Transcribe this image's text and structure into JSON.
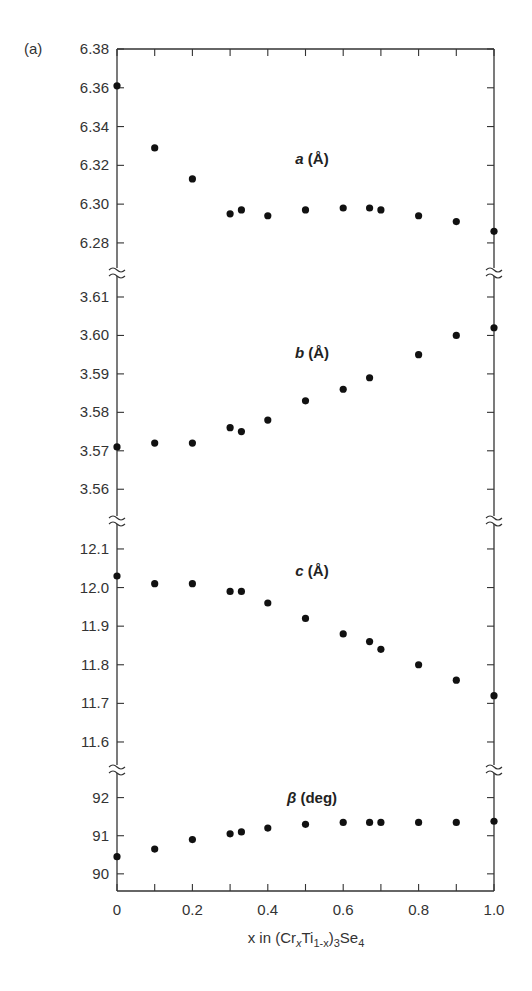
{
  "figure_label": "(a)",
  "chart_data": {
    "type": "scatter",
    "layout": "stacked-panels-shared-x-with-axis-breaks",
    "xlabel": "x in (CrxTi1-x)3Se4",
    "xlabel_parts": {
      "pre": "x in (Cr",
      "sub1": "x",
      "mid": "Ti",
      "sub2": "1-x",
      "post1": ")",
      "sub3": "3",
      "post2": "Se",
      "sub4": "4"
    },
    "xlim": [
      0,
      1.0
    ],
    "x_ticks": [
      0,
      0.1,
      0.2,
      0.3,
      0.4,
      0.5,
      0.6,
      0.7,
      0.8,
      0.9,
      1.0
    ],
    "x_tick_labels": [
      "0",
      "0.2",
      "0.4",
      "0.6",
      "0.8",
      "1.0"
    ],
    "x_tick_label_values": [
      0,
      0.2,
      0.4,
      0.6,
      0.8,
      1.0
    ],
    "grid": false,
    "legend": null,
    "panels": [
      {
        "name": "a",
        "label": "a (Å)",
        "label_var": "a",
        "label_unit": " (Å)",
        "ylim": [
          6.265,
          6.38
        ],
        "y_ticks": [
          6.28,
          6.3,
          6.32,
          6.34,
          6.36,
          6.38
        ],
        "y_tick_labels": [
          "6.28",
          "6.30",
          "6.32",
          "6.34",
          "6.36",
          "6.38"
        ],
        "x": [
          0,
          0.1,
          0.2,
          0.3,
          0.33,
          0.4,
          0.5,
          0.6,
          0.67,
          0.7,
          0.8,
          0.9,
          1.0
        ],
        "y": [
          6.361,
          6.329,
          6.313,
          6.295,
          6.297,
          6.294,
          6.297,
          6.298,
          6.298,
          6.297,
          6.294,
          6.291,
          6.286
        ]
      },
      {
        "name": "b",
        "label": "b (Å)",
        "label_var": "b",
        "label_unit": " (Å)",
        "ylim": [
          3.552,
          3.6165
        ],
        "y_ticks": [
          3.56,
          3.57,
          3.58,
          3.59,
          3.6,
          3.61
        ],
        "y_tick_labels": [
          "3.56",
          "3.57",
          "3.58",
          "3.59",
          "3.60",
          "3.61"
        ],
        "x": [
          0,
          0.1,
          0.2,
          0.3,
          0.33,
          0.4,
          0.5,
          0.6,
          0.67,
          0.8,
          0.9,
          1.0
        ],
        "y": [
          3.571,
          3.572,
          3.572,
          3.576,
          3.575,
          3.578,
          3.583,
          3.586,
          3.589,
          3.595,
          3.6,
          3.602
        ]
      },
      {
        "name": "c",
        "label": "c (Å)",
        "label_var": "c",
        "label_unit": " (Å)",
        "ylim": [
          11.53,
          12.175
        ],
        "y_ticks": [
          11.6,
          11.7,
          11.8,
          11.9,
          12.0,
          12.1
        ],
        "y_tick_labels": [
          "11.6",
          "11.7",
          "11.8",
          "11.9",
          "12.0",
          "12.1"
        ],
        "x": [
          0,
          0.1,
          0.2,
          0.3,
          0.33,
          0.4,
          0.5,
          0.6,
          0.67,
          0.7,
          0.8,
          0.9,
          1.0
        ],
        "y": [
          12.03,
          12.01,
          12.01,
          11.99,
          11.99,
          11.96,
          11.92,
          11.88,
          11.86,
          11.84,
          11.8,
          11.76,
          11.72
        ]
      },
      {
        "name": "beta",
        "label": "β (deg)",
        "label_var": "β",
        "label_unit": " (deg)",
        "ylim": [
          89.55,
          92.75
        ],
        "y_ticks": [
          90,
          91,
          92
        ],
        "y_tick_labels": [
          "90",
          "91",
          "92"
        ],
        "x": [
          0,
          0.1,
          0.2,
          0.3,
          0.33,
          0.4,
          0.5,
          0.6,
          0.67,
          0.7,
          0.8,
          0.9,
          1.0
        ],
        "y": [
          90.45,
          90.65,
          90.9,
          91.05,
          91.1,
          91.2,
          91.3,
          91.35,
          91.35,
          91.35,
          91.35,
          91.35,
          91.38
        ]
      }
    ]
  }
}
